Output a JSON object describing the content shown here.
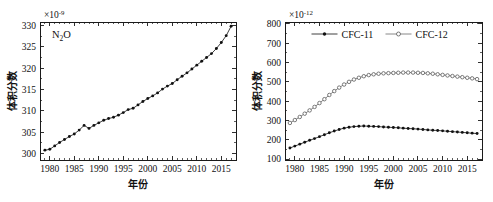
{
  "figure": {
    "width": 493,
    "height": 202,
    "background": "#ffffff",
    "panel_count": 2
  },
  "chart_data": [
    {
      "id": "n2o-panel",
      "type": "line",
      "title": "",
      "annotation": "N₂O",
      "annotation_parts": {
        "base1": "N",
        "sub": "2",
        "base2": "O"
      },
      "xlabel": "年份",
      "ylabel": "体积分数",
      "y_exponent_label": "×10",
      "y_exponent_power": "-9",
      "xlim": [
        1978,
        2018
      ],
      "ylim": [
        298.5,
        330.8
      ],
      "xticks": [
        1980,
        1985,
        1990,
        1995,
        2000,
        2005,
        2010,
        2015
      ],
      "yticks": [
        300,
        305,
        310,
        315,
        320,
        325,
        330
      ],
      "x_minor_interval": 1,
      "y_minor_interval": 2.5,
      "grid": false,
      "legend": false,
      "marker": "filled-circle",
      "series": [
        {
          "name": "N2O",
          "marker": "filled-circle",
          "x": [
            1979,
            1980,
            1981,
            1982,
            1983,
            1984,
            1985,
            1986,
            1987,
            1988,
            1989,
            1990,
            1991,
            1992,
            1993,
            1994,
            1995,
            1996,
            1997,
            1998,
            1999,
            2000,
            2001,
            2002,
            2003,
            2004,
            2005,
            2006,
            2007,
            2008,
            2009,
            2010,
            2011,
            2012,
            2013,
            2014,
            2015,
            2016,
            2017
          ],
          "values": [
            300.8,
            301.0,
            301.8,
            302.6,
            303.3,
            304.0,
            304.6,
            305.5,
            306.6,
            305.9,
            306.6,
            307.2,
            307.8,
            308.2,
            308.5,
            309.0,
            309.6,
            310.3,
            310.6,
            311.4,
            312.2,
            312.9,
            313.5,
            314.2,
            315.1,
            315.8,
            316.4,
            317.3,
            318.1,
            318.9,
            319.8,
            320.7,
            321.6,
            322.5,
            323.4,
            324.6,
            326.0,
            327.6,
            329.8
          ]
        }
      ]
    },
    {
      "id": "cfc-panel",
      "type": "line",
      "title": "",
      "xlabel": "年份",
      "ylabel": "体积分数",
      "y_exponent_label": "×10",
      "y_exponent_power": "-12",
      "xlim": [
        1978,
        2018
      ],
      "ylim": [
        95,
        810
      ],
      "xticks": [
        1980,
        1985,
        1990,
        1995,
        2000,
        2005,
        2010,
        2015
      ],
      "yticks": [
        100,
        200,
        300,
        400,
        500,
        600,
        700,
        800
      ],
      "x_minor_interval": 1,
      "y_minor_interval": 50,
      "grid": false,
      "legend": true,
      "legend_position": "top-center",
      "legend_entries": [
        {
          "label": "CFC-11",
          "marker": "filled-circle"
        },
        {
          "label": "CFC-12",
          "marker": "open-circle"
        }
      ],
      "series": [
        {
          "name": "CFC-11",
          "marker": "filled-circle",
          "x": [
            1979,
            1980,
            1981,
            1982,
            1983,
            1984,
            1985,
            1986,
            1987,
            1988,
            1989,
            1990,
            1991,
            1992,
            1993,
            1994,
            1995,
            1996,
            1997,
            1998,
            1999,
            2000,
            2001,
            2002,
            2003,
            2004,
            2005,
            2006,
            2007,
            2008,
            2009,
            2010,
            2011,
            2012,
            2013,
            2014,
            2015,
            2016,
            2017
          ],
          "values": [
            157,
            167,
            177,
            187,
            197,
            206,
            216,
            226,
            236,
            245,
            253,
            260,
            265,
            268,
            270,
            271,
            270,
            269,
            268,
            266,
            265,
            263,
            262,
            260,
            258,
            257,
            255,
            253,
            251,
            249,
            248,
            246,
            244,
            242,
            240,
            238,
            236,
            234,
            232
          ]
        },
        {
          "name": "CFC-12",
          "marker": "open-circle",
          "x": [
            1979,
            1980,
            1981,
            1982,
            1983,
            1984,
            1985,
            1986,
            1987,
            1988,
            1989,
            1990,
            1991,
            1992,
            1993,
            1994,
            1995,
            1996,
            1997,
            1998,
            1999,
            2000,
            2001,
            2002,
            2003,
            2004,
            2005,
            2006,
            2007,
            2008,
            2009,
            2010,
            2011,
            2012,
            2013,
            2014,
            2015,
            2016,
            2017
          ],
          "values": [
            287,
            302,
            318,
            335,
            352,
            370,
            390,
            410,
            432,
            452,
            470,
            486,
            500,
            512,
            521,
            529,
            535,
            539,
            542,
            544,
            545,
            546,
            547,
            548,
            548,
            548,
            547,
            546,
            544,
            542,
            539,
            536,
            533,
            530,
            527,
            524,
            521,
            518,
            514
          ]
        }
      ]
    }
  ]
}
